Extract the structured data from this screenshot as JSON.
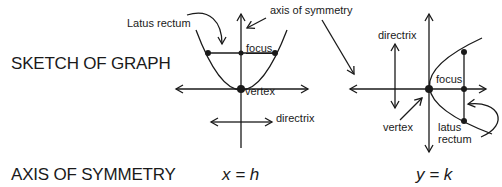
{
  "rows": {
    "sketch_label": "SKETCH OF GRAPH",
    "axis_label": "AXIS OF SYMMETRY"
  },
  "vertical_parabola": {
    "labels": {
      "latus_rectum": "Latus rectum",
      "axis_of_symmetry": "axis of symmetry",
      "focus": "focus",
      "vertex": "vertex",
      "directrix": "directrix"
    },
    "axis_equation": "x = h"
  },
  "horizontal_parabola": {
    "labels": {
      "directrix": "directrix",
      "focus": "focus",
      "vertex": "vertex",
      "latus_rectum_line1": "latus",
      "latus_rectum_line2": "rectum"
    },
    "axis_equation": "y = k"
  },
  "colors": {
    "ink": "#1a1a1a",
    "background": "#ffffff"
  }
}
